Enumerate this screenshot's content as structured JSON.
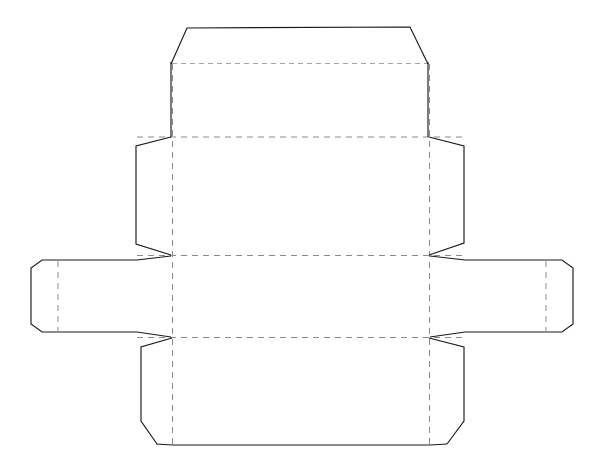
{
  "document": {
    "kind": "packaging-dieline",
    "title": "Box Dieline Template",
    "canvas": {
      "width": 605,
      "height": 475,
      "background": "#ffffff"
    }
  },
  "styles": {
    "cut_line_color": "#1a1a1a",
    "cut_line_width": 1.15,
    "fold_line_color": "#8a8a8a",
    "fold_line_width": 1,
    "fold_dash_pattern": "6 5"
  },
  "legend": {
    "cut_label": "cut line",
    "fold_label": "fold line"
  },
  "geometry": {
    "cut_outline": "M 187,28 L 410,27 L 428,63 L 428,137 L 464,146 L 464,243 L 429,255 L 429,256 L 465,256 L 465,260 L 573,260 L 581,269 L 581,324 L 573,332 L 465,332 L 465,337 L 429,337 L 429,338 L 464,347 L 464,421 L 447,436 L 447,444 L 430,445 L 173,445 L 156,444 L 156,436 L 141,421 L 141,347 L 172,338 L 172,337 L 137,337 L 137,332 L 31,332 L 23,324 L 23,269 L 31,260 L 137,260 L 137,256 L 172,256 L 172,255 L 136,244 L 136,146 L 171,137 L 171,63 Z",
    "panels": [
      {
        "name": "top-hood-flap",
        "points": "171,63 187,28 410,27 428,63"
      },
      {
        "name": "top-panel",
        "points": "171,63 428,63 428,137 171,137"
      },
      {
        "name": "left-upper-tab",
        "points": "136,146 171,137 171,255 136,244"
      },
      {
        "name": "right-upper-tab",
        "points": "428,137 464,146 464,243 429,255"
      },
      {
        "name": "center-panel",
        "points": "172,137 429,137 429,255 172,255"
      },
      {
        "name": "lower-center-panel",
        "points": "172,256 429,256 429,337 172,337"
      },
      {
        "name": "left-side-panel",
        "points": "31,260 137,260 137,332 31,332"
      },
      {
        "name": "right-side-panel",
        "points": "465,260 573,260 573,332 465,332"
      },
      {
        "name": "left-lower-tab",
        "points": "141,347 172,338 172,444 141,421"
      },
      {
        "name": "right-lower-tab",
        "points": "429,338 464,347 464,421 430,444"
      },
      {
        "name": "bottom-panel",
        "points": "173,338 429,338 430,445 173,445"
      }
    ],
    "fold_lines": [
      {
        "name": "fold-top-horizontal",
        "x1": 172,
        "y1": 63.5,
        "x2": 428,
        "y2": 63.5,
        "style": "light"
      },
      {
        "name": "fold-upper-horizontal",
        "x1": 137,
        "y1": 137,
        "x2": 464,
        "y2": 137,
        "style": "normal"
      },
      {
        "name": "fold-middle-horizontal",
        "x1": 137,
        "y1": 255.5,
        "x2": 464,
        "y2": 255.5,
        "style": "normal"
      },
      {
        "name": "fold-lower-horizontal",
        "x1": 137,
        "y1": 337.5,
        "x2": 464,
        "y2": 337.5,
        "style": "normal"
      },
      {
        "name": "fold-left-vertical",
        "x1": 172.5,
        "y1": 64,
        "x2": 172.5,
        "y2": 444,
        "style": "normal"
      },
      {
        "name": "fold-right-vertical",
        "x1": 429.5,
        "y1": 64,
        "x2": 429.5,
        "y2": 444,
        "style": "normal"
      },
      {
        "name": "fold-left-side-vertical",
        "x1": 58,
        "y1": 261,
        "x2": 58,
        "y2": 331,
        "style": "normal"
      },
      {
        "name": "fold-right-side-vertical",
        "x1": 546,
        "y1": 261,
        "x2": 546,
        "y2": 331,
        "style": "normal"
      }
    ]
  }
}
